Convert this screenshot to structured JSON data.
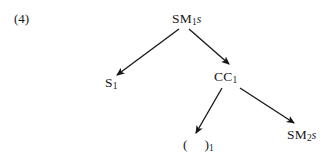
{
  "figure": {
    "equation_number": "(4)",
    "background_color": "#ffffff",
    "ink_color": "#18181a",
    "nodes": {
      "root": {
        "base": "SM",
        "subscript": "1",
        "suffix": "s"
      },
      "left": {
        "base": "S",
        "subscript": "1",
        "suffix": ""
      },
      "mid": {
        "base": "CC",
        "subscript": "1",
        "suffix": ""
      },
      "paren": {
        "open": "(",
        "close": ")",
        "subscript": "1"
      },
      "right": {
        "base": "SM",
        "subscript": "2",
        "suffix": "s"
      }
    },
    "edges": [
      {
        "name": "root-to-s1",
        "from": "SM1s",
        "to": "S1",
        "x1": 179,
        "y1": 29,
        "x2": 117,
        "y2": 75
      },
      {
        "name": "root-to-cc1",
        "from": "SM1s",
        "to": "CC1",
        "x1": 189,
        "y1": 29,
        "x2": 229,
        "y2": 64
      },
      {
        "name": "cc1-to-paren",
        "from": "CC1",
        "to": "( )1",
        "x1": 222,
        "y1": 88,
        "x2": 196,
        "y2": 133
      },
      {
        "name": "cc1-to-sm2s",
        "from": "CC1",
        "to": "SM2s",
        "x1": 240,
        "y1": 88,
        "x2": 294,
        "y2": 123
      }
    ]
  }
}
